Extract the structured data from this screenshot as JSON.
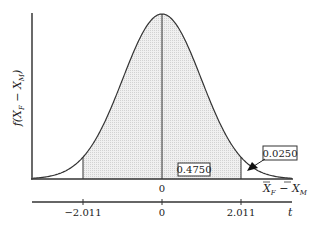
{
  "chart_data": {
    "type": "area",
    "title": "",
    "ylabel": "f(X̄F − X̄M)",
    "xlabel_top": "X̄F − X̄M",
    "xlabel_bottom": "t",
    "top_axis_ticks": [
      "0"
    ],
    "bottom_axis_ticks": [
      "−2.011",
      "0",
      "2.011"
    ],
    "critical_values": [
      -2.011,
      2.011
    ],
    "mean": 0,
    "shaded_region": [
      -2.011,
      2.011
    ],
    "annotations": [
      {
        "label": "0.4750",
        "region": "0 to 2.011"
      },
      {
        "label": "0.0250",
        "region": "right tail beyond 2.011"
      }
    ],
    "colors": {
      "curve": "#333333",
      "fill": "#e6e6e6",
      "axis": "#333333"
    }
  },
  "labels": {
    "y_f": "f(",
    "y_X1": "X",
    "y_sub1": "F",
    "y_minus": " − ",
    "y_X2": "X",
    "y_sub2": "M",
    "y_close": ")",
    "top_zero": "0",
    "x_X1": "X",
    "x_sub1": "F",
    "x_minus": " − ",
    "x_X2": "X",
    "x_sub2": "M",
    "t_neg": "−2.011",
    "t_zero": "0",
    "t_pos": "2.011",
    "t_label": "t",
    "box_center": "0.4750",
    "box_tail": "0.0250"
  }
}
